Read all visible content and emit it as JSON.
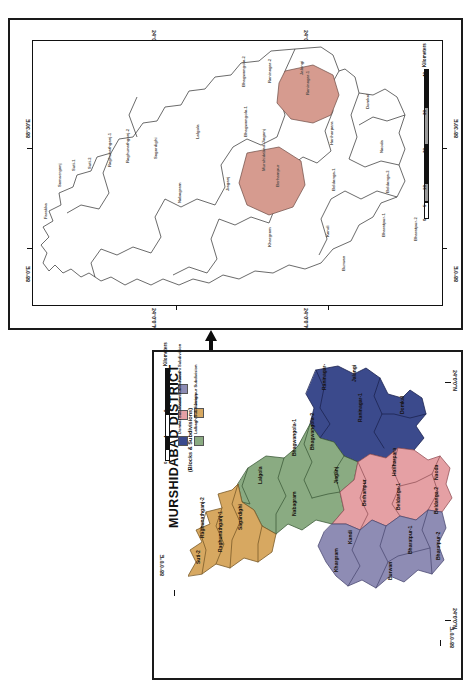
{
  "figure": {
    "orientation": "rotated-90-ccw",
    "background": "#ffffff"
  },
  "main_map": {
    "title": "MURSHIDABAD DISTRICT",
    "subtitle": "(Blocks & Subdivisions)",
    "graticule": {
      "top_left": "24°0'0\"N",
      "top_right": "24°0'0\"N",
      "bottom_left": "24°0'0\"N",
      "bottom_right": "24°0'0\"N",
      "lon_left": "88°0'0\"E",
      "lon_right": "88°0'0\"E"
    },
    "scale_bar": {
      "values": [
        "0",
        "4",
        "8"
      ],
      "unit": "Kilometers"
    },
    "legend": {
      "title": "(Blocks & Subdivisions)",
      "items": [
        {
          "label": "Jangipur Subdivision",
          "color": "#d7a861"
        },
        {
          "label": "Lalbagh Subdivision",
          "color": "#8aab82"
        },
        {
          "label": "Kandhi Subdivision",
          "color": "#8e8cb4"
        },
        {
          "label": "Sadar Subdivision",
          "color": "#e5a0a4"
        },
        {
          "label": "Domkal Subdivision",
          "color": "#3b4a8c"
        }
      ]
    },
    "blocks": [
      {
        "name": "Farakka",
        "subdivision": "Jangipur"
      },
      {
        "name": "Samserganj",
        "subdivision": "Jangipur"
      },
      {
        "name": "Suti-1",
        "subdivision": "Jangipur"
      },
      {
        "name": "Suti-2",
        "subdivision": "Jangipur"
      },
      {
        "name": "Raghunathganj-1",
        "subdivision": "Jangipur"
      },
      {
        "name": "Raghunathganj-2",
        "subdivision": "Jangipur"
      },
      {
        "name": "Sagardighi",
        "subdivision": "Jangipur"
      },
      {
        "name": "Lalgola",
        "subdivision": "Lalbagh"
      },
      {
        "name": "Bhagwangola-1",
        "subdivision": "Lalbagh"
      },
      {
        "name": "Bhagwangola-2",
        "subdivision": "Lalbagh"
      },
      {
        "name": "Jiaganj",
        "subdivision": "Lalbagh"
      },
      {
        "name": "Murshidabad-Jiaganj",
        "subdivision": "Lalbagh"
      },
      {
        "name": "Nabagram",
        "subdivision": "Lalbagh"
      },
      {
        "name": "Raninagar-1",
        "subdivision": "Domkal"
      },
      {
        "name": "Raninagar-2",
        "subdivision": "Domkal"
      },
      {
        "name": "Jalangi",
        "subdivision": "Domkal"
      },
      {
        "name": "Domkal",
        "subdivision": "Domkal"
      },
      {
        "name": "Hariharpara",
        "subdivision": "Sadar"
      },
      {
        "name": "Naoda",
        "subdivision": "Sadar"
      },
      {
        "name": "Berhampur",
        "subdivision": "Sadar"
      },
      {
        "name": "Beldanga-1",
        "subdivision": "Sadar"
      },
      {
        "name": "Beldanga-2",
        "subdivision": "Sadar"
      },
      {
        "name": "Kandi",
        "subdivision": "Kandhi"
      },
      {
        "name": "Khargram",
        "subdivision": "Kandhi"
      },
      {
        "name": "Burwan",
        "subdivision": "Kandhi"
      },
      {
        "name": "Bharatpur-1",
        "subdivision": "Kandhi"
      },
      {
        "name": "Bharatpur-2",
        "subdivision": "Kandhi"
      }
    ]
  },
  "inset_map": {
    "graticule": {
      "top_left": "24°0'0\"N",
      "top_right": "24°0'0\"N",
      "bottom_left": "24°0'0\"N",
      "bottom_right": "24°0'0\"N",
      "lon_left_top": "88°30'E",
      "lon_left_bottom": "88°0'E",
      "lon_right_top": "88°30'E",
      "lon_right_bottom": "88°0'E"
    },
    "scale_bar": {
      "values": [
        "0",
        "5",
        "10",
        "20",
        "30",
        "40"
      ],
      "unit": "Kilometers"
    },
    "highlight_color": "#d69b8f",
    "highlighted_blocks": [
      "Raninagar-1",
      "Berhampur"
    ],
    "blocks": [
      "Jalangi",
      "Domkal",
      "Raninagar-2",
      "Raninagar-1",
      "Bhagwangola-2",
      "Bhagwangola-1",
      "Lalgola",
      "Sagardighi",
      "Raghunathganj-2",
      "Raghunathganj-1",
      "Suti-2",
      "Suti-1",
      "Samserganj",
      "Farakka",
      "Nabagram",
      "Murshidabad-Jiaganj",
      "Jiaganj",
      "Hariharpara",
      "Naoda",
      "Berhampur",
      "Beldanga-1",
      "Beldanga-2",
      "Kandi",
      "Khargram",
      "Burwan",
      "Bharatpur-1",
      "Bharatpur-2"
    ]
  }
}
